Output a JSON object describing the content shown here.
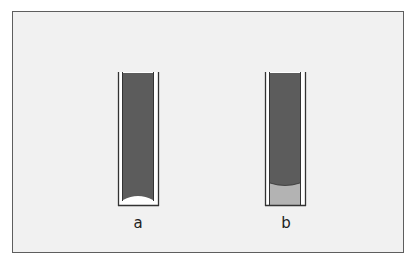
{
  "figure": {
    "panel_a": {
      "label": "a",
      "description": "Tube with dark liquid column showing concave meniscus at bottom"
    },
    "panel_b": {
      "label": "b",
      "description": "Tube with dark liquid column above lighter liquid, convex interface"
    }
  },
  "colors": {
    "frame_bg": "#f1f1f1",
    "frame_border": "#5e5e5e",
    "dark_liquid": "#5c5c5c",
    "light_liquid": "#b3b3b3",
    "tube_line": "#333333"
  }
}
